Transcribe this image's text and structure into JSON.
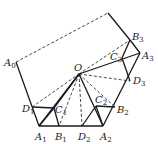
{
  "diagram": {
    "type": "geometry",
    "points": {
      "A0": {
        "label": "A",
        "sub": "0",
        "x": 16,
        "y": 62,
        "lx": 4,
        "ly": 66
      },
      "T": {
        "x": 108,
        "y": 13
      },
      "B3": {
        "label": "B",
        "sub": "3",
        "x": 130,
        "y": 40,
        "lx": 132,
        "ly": 40
      },
      "A3": {
        "label": "A",
        "sub": "3",
        "x": 140,
        "y": 53,
        "lx": 142,
        "ly": 59
      },
      "C3": {
        "label": "C",
        "sub": "3",
        "x": 122,
        "y": 58,
        "lx": 110,
        "ly": 60
      },
      "O": {
        "label": "O",
        "sub": "",
        "x": 79,
        "y": 74,
        "lx": 74,
        "ly": 71
      },
      "D3": {
        "label": "D",
        "sub": "3",
        "x": 130,
        "y": 81,
        "lx": 133,
        "ly": 84
      },
      "D1": {
        "label": "D",
        "sub": "1",
        "x": 32,
        "y": 107,
        "lx": 22,
        "ly": 112
      },
      "C1": {
        "label": "C",
        "sub": "1",
        "x": 54,
        "y": 108,
        "lx": 55,
        "ly": 113
      },
      "C2": {
        "label": "C",
        "sub": "2",
        "x": 96,
        "y": 106,
        "lx": 95,
        "ly": 103
      },
      "B2": {
        "label": "B",
        "sub": "2",
        "x": 115,
        "y": 107,
        "lx": 117,
        "ly": 113
      },
      "A1": {
        "label": "A",
        "sub": "1",
        "x": 39,
        "y": 126,
        "lx": 35,
        "ly": 140
      },
      "B1": {
        "label": "B",
        "sub": "1",
        "x": 59,
        "y": 126,
        "lx": 55,
        "ly": 140
      },
      "D2": {
        "label": "D",
        "sub": "2",
        "x": 82,
        "y": 126,
        "lx": 78,
        "ly": 140
      },
      "A2": {
        "label": "A",
        "sub": "2",
        "x": 103,
        "y": 126,
        "lx": 100,
        "ly": 140
      }
    },
    "solid_segments": [
      [
        "A0",
        "A1"
      ],
      [
        "A1",
        "A2"
      ],
      [
        "A2",
        "A3"
      ],
      [
        "A3",
        "B3"
      ],
      [
        "B3",
        "T"
      ],
      [
        "D1",
        "C1"
      ],
      [
        "A1",
        "C1"
      ],
      [
        "C1",
        "B1"
      ],
      [
        "C1",
        "O"
      ],
      [
        "C2",
        "B2"
      ],
      [
        "D2",
        "C2"
      ],
      [
        "C2",
        "A2"
      ],
      [
        "B3",
        "C3"
      ],
      [
        "C3",
        "D3"
      ],
      [
        "O",
        "A3"
      ],
      [
        "O",
        "A1"
      ],
      [
        "O",
        "A2"
      ]
    ],
    "dashed_segments": [
      [
        "A0",
        "T"
      ],
      [
        "D1",
        "O"
      ],
      [
        "O",
        "B1"
      ],
      [
        "O",
        "D2"
      ],
      [
        "O",
        "B2"
      ],
      [
        "O",
        "D3"
      ],
      [
        "O",
        "B3"
      ]
    ]
  }
}
